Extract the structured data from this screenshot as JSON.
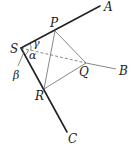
{
  "figure": {
    "type": "geometry",
    "points": {
      "S": {
        "label": "S",
        "x": 21,
        "y": 48
      },
      "A": {
        "label": "A",
        "x": 100,
        "y": 6
      },
      "B": {
        "label": "B",
        "x": 116,
        "y": 69
      },
      "C": {
        "label": "C",
        "x": 67,
        "y": 132
      },
      "P": {
        "label": "P",
        "x": 55,
        "y": 31
      },
      "Q": {
        "label": "Q",
        "x": 86,
        "y": 63
      },
      "R": {
        "label": "R",
        "x": 44,
        "y": 89
      }
    },
    "angles": {
      "alpha": "α",
      "beta": "β",
      "gamma": "γ"
    },
    "segments": {
      "thick": [
        "SA",
        "SC"
      ],
      "thin": [
        "QB",
        "PQ",
        "QR",
        "PR"
      ],
      "dashed": [
        "SQ"
      ]
    }
  }
}
